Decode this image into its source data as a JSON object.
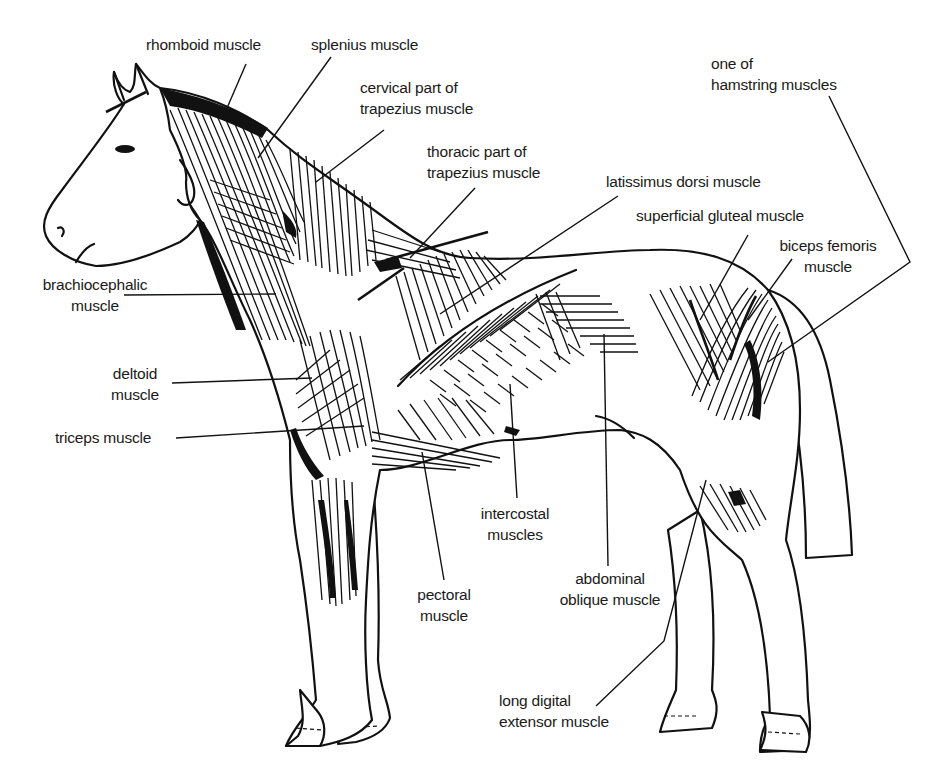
{
  "figure": {
    "labels": [
      {
        "id": "rhomboid",
        "lines": [
          "rhomboid muscle"
        ]
      },
      {
        "id": "splenius",
        "lines": [
          "splenius muscle"
        ]
      },
      {
        "id": "cervical-trapezius",
        "lines": [
          "cervical  part of",
          "trapezius  muscle"
        ]
      },
      {
        "id": "thoracic-trapezius",
        "lines": [
          "thoracic  part of",
          "trapezius muscle"
        ]
      },
      {
        "id": "latissimus-dorsi",
        "lines": [
          "latissimus dorsi muscle"
        ]
      },
      {
        "id": "superficial-gluteal",
        "lines": [
          "superficial gluteal muscle"
        ]
      },
      {
        "id": "hamstring",
        "lines": [
          "one of",
          "hamstring muscles"
        ]
      },
      {
        "id": "biceps-femoris",
        "lines": [
          "biceps femoris",
          "muscle"
        ]
      },
      {
        "id": "brachiocephalic",
        "lines": [
          "brachiocephalic",
          "muscle"
        ]
      },
      {
        "id": "deltoid",
        "lines": [
          "deltoid",
          "muscle"
        ]
      },
      {
        "id": "triceps",
        "lines": [
          "triceps muscle"
        ]
      },
      {
        "id": "intercostal",
        "lines": [
          "intercostal",
          "muscles"
        ]
      },
      {
        "id": "pectoral",
        "lines": [
          "pectoral",
          "muscle"
        ]
      },
      {
        "id": "abdominal-oblique",
        "lines": [
          "abdominal",
          "oblique  muscle"
        ]
      },
      {
        "id": "long-digital-extensor",
        "lines": [
          "long digital",
          "extensor muscle"
        ]
      }
    ]
  }
}
